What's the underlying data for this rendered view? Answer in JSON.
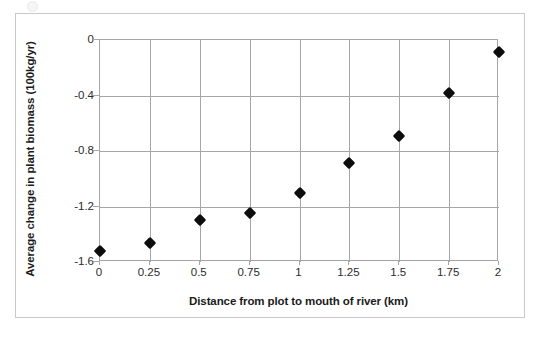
{
  "chart_data": {
    "type": "scatter",
    "title": "",
    "xlabel": "Distance from plot to mouth of river (km)",
    "ylabel": "Average change in plant biomass (100kg/yr)",
    "xlim": [
      0,
      2
    ],
    "ylim": [
      -1.6,
      0
    ],
    "xticks": [
      "0",
      "0.25",
      "0.5",
      "0.75",
      "1",
      "1.25",
      "1.5",
      "1.75",
      "2"
    ],
    "xtick_values": [
      0,
      0.25,
      0.5,
      0.75,
      1,
      1.25,
      1.5,
      1.75,
      2
    ],
    "yticks": [
      "0",
      "-0.4",
      "-0.8",
      "-1.2",
      "-1.6"
    ],
    "ytick_values": [
      0,
      -0.4,
      -0.8,
      -1.2,
      -1.6
    ],
    "grid": true,
    "legend": false,
    "marker": "diamond",
    "marker_color": "#0d0d0d",
    "axis_color": "#a6a6a6",
    "x": [
      0,
      0.25,
      0.5,
      0.75,
      1,
      1.25,
      1.5,
      1.75,
      2
    ],
    "y": [
      -1.52,
      -1.46,
      -1.3,
      -1.25,
      -1.1,
      -0.89,
      -0.69,
      -0.38,
      -0.09
    ],
    "points": [
      {
        "x": 0,
        "y": -1.52
      },
      {
        "x": 0.25,
        "y": -1.46
      },
      {
        "x": 0.5,
        "y": -1.3
      },
      {
        "x": 0.75,
        "y": -1.25
      },
      {
        "x": 1,
        "y": -1.1
      },
      {
        "x": 1.25,
        "y": -0.89
      },
      {
        "x": 1.5,
        "y": -0.69
      },
      {
        "x": 1.75,
        "y": -0.38
      },
      {
        "x": 2,
        "y": -0.09
      }
    ]
  }
}
